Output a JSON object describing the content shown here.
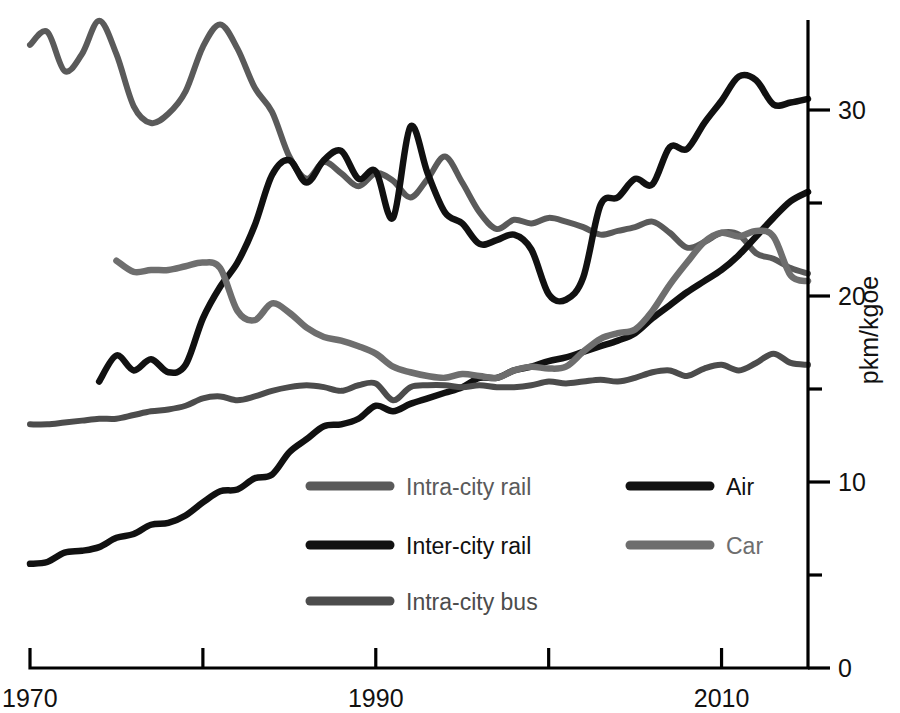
{
  "chart_data": {
    "type": "line",
    "title": "",
    "xlabel": "",
    "ylabel": "pkm/kgoe",
    "xlim": [
      1970,
      2015
    ],
    "ylim": [
      0,
      35
    ],
    "xticks": [
      1970,
      1980,
      1990,
      2000,
      2010
    ],
    "xtick_labels": [
      "1970",
      "",
      "1990",
      "",
      "2010"
    ],
    "yticks": [
      0,
      5,
      10,
      15,
      20,
      25,
      30
    ],
    "ytick_labels": [
      "0",
      "",
      "10",
      "",
      "20",
      "",
      "30"
    ],
    "grid": false,
    "legend_position": "inside-bottom-center",
    "series": [
      {
        "name": "Intra-city rail",
        "color": "#5a5a5a",
        "width": 6,
        "x": [
          1970,
          1971,
          1972,
          1973,
          1974,
          1975,
          1976,
          1977,
          1978,
          1979,
          1980,
          1981,
          1982,
          1983,
          1984,
          1985,
          1986,
          1987,
          1988,
          1989,
          1990,
          1991,
          1992,
          1993,
          1994,
          1995,
          1996,
          1997,
          1998,
          1999,
          2000,
          2001,
          2002,
          2003,
          2004,
          2005,
          2006,
          2007,
          2008,
          2009,
          2010,
          2011,
          2012,
          2013,
          2014,
          2015
        ],
        "values": [
          33.5,
          34.2,
          32.1,
          33.0,
          34.8,
          33.0,
          30.2,
          29.3,
          29.8,
          31.0,
          33.4,
          34.6,
          33.3,
          31.2,
          29.9,
          27.5,
          26.3,
          27.2,
          26.6,
          25.9,
          26.6,
          26.2,
          25.3,
          26.3,
          27.5,
          26.1,
          24.5,
          23.6,
          24.1,
          23.9,
          24.2,
          24.0,
          23.7,
          23.3,
          23.5,
          23.7,
          24.0,
          23.4,
          22.6,
          22.9,
          23.4,
          23.3,
          22.3,
          22.0,
          21.5,
          21.2
        ]
      },
      {
        "name": "Inter-city rail",
        "color": "#111111",
        "width": 6.5,
        "x": [
          1970,
          1971,
          1972,
          1973,
          1974,
          1975,
          1976,
          1977,
          1978,
          1979,
          1980,
          1981,
          1982,
          1983,
          1984,
          1985,
          1986,
          1987,
          1988,
          1989,
          1990,
          1991,
          1992,
          1993,
          1994,
          1995,
          1996,
          1997,
          1998,
          1999,
          2000,
          2001,
          2002,
          2003,
          2004,
          2005,
          2006,
          2007,
          2008,
          2009,
          2010,
          2011,
          2012,
          2013,
          2014,
          2015
        ],
        "values": [
          5.6,
          5.7,
          6.2,
          6.3,
          6.5,
          7.0,
          7.2,
          7.7,
          7.8,
          8.2,
          8.9,
          9.5,
          9.6,
          10.2,
          10.4,
          11.6,
          12.3,
          13.0,
          13.1,
          13.4,
          14.1,
          13.8,
          14.2,
          14.5,
          14.8,
          15.1,
          15.6,
          15.6,
          16.0,
          16.2,
          16.5,
          16.7,
          17.0,
          17.3,
          17.6,
          18.0,
          18.8,
          19.5,
          20.2,
          20.8,
          21.4,
          22.2,
          23.2,
          24.2,
          25.1,
          25.6
        ]
      },
      {
        "name": "Intra-city bus",
        "color": "#4c4c4c",
        "width": 6,
        "x": [
          1970,
          1971,
          1972,
          1973,
          1974,
          1975,
          1976,
          1977,
          1978,
          1979,
          1980,
          1981,
          1982,
          1983,
          1984,
          1985,
          1986,
          1987,
          1988,
          1989,
          1990,
          1991,
          1992,
          1993,
          1994,
          1995,
          1996,
          1997,
          1998,
          1999,
          2000,
          2001,
          2002,
          2003,
          2004,
          2005,
          2006,
          2007,
          2008,
          2009,
          2010,
          2011,
          2012,
          2013,
          2014,
          2015
        ],
        "values": [
          13.1,
          13.1,
          13.2,
          13.3,
          13.4,
          13.4,
          13.6,
          13.8,
          13.9,
          14.1,
          14.5,
          14.6,
          14.4,
          14.6,
          14.9,
          15.1,
          15.2,
          15.1,
          14.9,
          15.2,
          15.3,
          14.4,
          15.1,
          15.2,
          15.2,
          15.1,
          15.2,
          15.1,
          15.1,
          15.2,
          15.4,
          15.3,
          15.4,
          15.5,
          15.4,
          15.6,
          15.9,
          16.0,
          15.7,
          16.1,
          16.3,
          16.0,
          16.4,
          16.9,
          16.4,
          16.3
        ]
      },
      {
        "name": "Air",
        "color": "#111111",
        "width": 6.5,
        "x": [
          1974,
          1975,
          1976,
          1977,
          1978,
          1979,
          1980,
          1981,
          1982,
          1983,
          1984,
          1985,
          1986,
          1987,
          1988,
          1989,
          1990,
          1991,
          1992,
          1993,
          1994,
          1995,
          1996,
          1997,
          1998,
          1999,
          2000,
          2001,
          2002,
          2003,
          2004,
          2005,
          2006,
          2007,
          2008,
          2009,
          2010,
          2011,
          2012,
          2013,
          2014,
          2015
        ],
        "values": [
          15.4,
          16.8,
          16.0,
          16.6,
          15.9,
          16.3,
          18.8,
          20.5,
          21.8,
          23.8,
          26.5,
          27.3,
          26.1,
          27.3,
          27.8,
          26.3,
          26.7,
          24.2,
          29.1,
          26.6,
          24.5,
          23.9,
          22.8,
          23.0,
          23.3,
          22.5,
          20.1,
          19.8,
          21.0,
          24.9,
          25.3,
          26.3,
          26.0,
          28.0,
          27.9,
          29.3,
          30.5,
          31.8,
          31.6,
          30.3,
          30.4,
          30.6
        ]
      },
      {
        "name": "Car",
        "color": "#6e6e6e",
        "width": 6.5,
        "x": [
          1975,
          1976,
          1977,
          1978,
          1979,
          1980,
          1981,
          1982,
          1983,
          1984,
          1985,
          1986,
          1987,
          1988,
          1989,
          1990,
          1991,
          1992,
          1993,
          1994,
          1995,
          1996,
          1997,
          1998,
          1999,
          2000,
          2001,
          2002,
          2003,
          2004,
          2005,
          2006,
          2007,
          2008,
          2009,
          2010,
          2011,
          2012,
          2013,
          2014,
          2015
        ],
        "values": [
          21.9,
          21.3,
          21.4,
          21.4,
          21.6,
          21.8,
          21.5,
          19.2,
          18.7,
          19.6,
          19.1,
          18.3,
          17.8,
          17.6,
          17.3,
          16.9,
          16.2,
          15.9,
          15.7,
          15.6,
          15.8,
          15.7,
          15.6,
          16.0,
          16.2,
          16.1,
          16.2,
          17.0,
          17.7,
          18.0,
          18.2,
          19.2,
          20.6,
          21.8,
          22.9,
          23.4,
          23.2,
          23.5,
          23.2,
          21.1,
          20.8
        ]
      }
    ],
    "legend": [
      {
        "name": "Intra-city rail",
        "color": "#5a5a5a"
      },
      {
        "name": "Inter-city rail",
        "color": "#111111"
      },
      {
        "name": "Intra-city bus",
        "color": "#4c4c4c"
      },
      {
        "name": "Air",
        "color": "#111111"
      },
      {
        "name": "Car",
        "color": "#6e6e6e"
      }
    ]
  }
}
